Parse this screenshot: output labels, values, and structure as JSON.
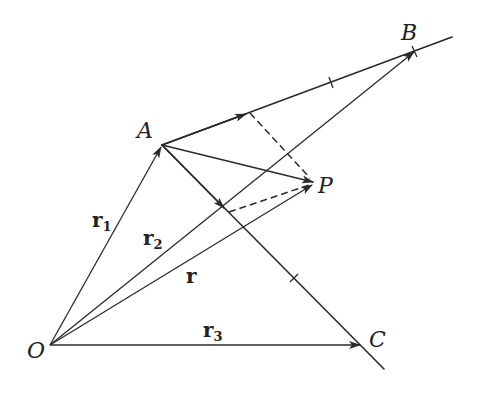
{
  "diagram": {
    "colors": {
      "ink": "#2a2a2a",
      "background": "#ffffff"
    },
    "points": {
      "O": {
        "label": "O",
        "x": 50,
        "y": 345
      },
      "A": {
        "label": "A",
        "x": 162,
        "y": 145
      },
      "B": {
        "label": "B",
        "x": 415,
        "y": 51
      },
      "C": {
        "label": "C",
        "x": 361,
        "y": 345
      },
      "P": {
        "label": "P",
        "x": 313,
        "y": 183
      }
    },
    "vectors": {
      "r1": {
        "label": "r",
        "subscript": "1",
        "from": "O",
        "to": "A"
      },
      "r2": {
        "label": "r",
        "subscript": "2",
        "from": "O",
        "to": "B"
      },
      "r": {
        "label": "r",
        "subscript": "",
        "from": "O",
        "to": "P"
      },
      "r3": {
        "label": "r",
        "subscript": "3",
        "from": "O",
        "to": "C"
      }
    },
    "lines": [
      {
        "name": "line-AB",
        "through": [
          "A",
          "B"
        ],
        "extends_past": "B"
      },
      {
        "name": "line-AC",
        "through": [
          "A",
          "C"
        ],
        "extends_past": "C"
      }
    ],
    "dashed_segments": [
      {
        "name": "projection-P-onto-AB",
        "from": "P",
        "to": "foot on AB"
      },
      {
        "name": "projection-P-onto-AC",
        "from": "P",
        "to": "foot on AC"
      }
    ],
    "tick_marks": [
      "midpoint-like tick on AB",
      "tick on AC"
    ]
  }
}
